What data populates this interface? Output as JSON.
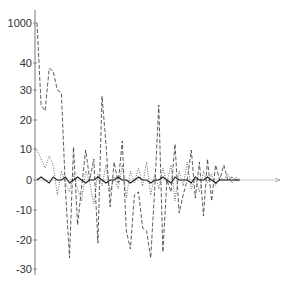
{
  "chart_data": {
    "type": "line",
    "title": "",
    "xlabel": "",
    "ylabel": "",
    "y_ticks": [
      "1000",
      "40",
      "30",
      "20",
      "10",
      "0",
      "-10",
      "-20",
      "-30"
    ],
    "ylim": [
      -30,
      1000
    ],
    "y_axis_break": "between 40 and 1000",
    "grid": false,
    "legend": null,
    "x": [
      0,
      2,
      4,
      6,
      8,
      10,
      12,
      14,
      16,
      18,
      20,
      22,
      24,
      26,
      28,
      30,
      32,
      34,
      36,
      38,
      40,
      42,
      44,
      46,
      48,
      50,
      52,
      54,
      56,
      58,
      60,
      62,
      64,
      66,
      68,
      70,
      72,
      74,
      76,
      78,
      80,
      82,
      84,
      86,
      88,
      90,
      92,
      94,
      96,
      98,
      100
    ],
    "series": [
      {
        "name": "dashed",
        "style": "dashed",
        "values": [
          1000,
          25,
          23,
          38,
          37,
          30,
          29,
          -3,
          -26,
          11,
          -15,
          -2,
          10,
          0,
          7,
          -21,
          28,
          12,
          -9,
          6,
          -1,
          13,
          -17,
          -23,
          -5,
          -4,
          -16,
          -17,
          -26,
          -3,
          25,
          -24,
          0,
          -4,
          12,
          -11,
          -5,
          0,
          10,
          -6,
          6,
          -12,
          7,
          -7,
          5,
          0,
          5,
          0,
          1,
          0,
          0
        ]
      },
      {
        "name": "dotted",
        "style": "dotted",
        "values": [
          10,
          7,
          4,
          8,
          5,
          -5,
          3,
          -1,
          -4,
          2,
          -3,
          -7,
          3,
          -1,
          -8,
          2,
          -2,
          5,
          -4,
          1,
          -3,
          5,
          -6,
          3,
          -1,
          4,
          -2,
          6,
          -5,
          2,
          -3,
          4,
          -1,
          5,
          -7,
          3,
          -2,
          6,
          -3,
          1,
          -4,
          3,
          -1,
          2,
          -2,
          1,
          0,
          2,
          -1,
          1,
          0
        ]
      },
      {
        "name": "solid",
        "style": "solid",
        "values": [
          0,
          1,
          0,
          -1,
          1,
          0,
          0,
          1,
          -1,
          0,
          1,
          0,
          -1,
          0,
          0,
          1,
          0,
          -1,
          0,
          0,
          1,
          0,
          0,
          -1,
          0,
          1,
          0,
          0,
          -1,
          0,
          0,
          1,
          0,
          -1,
          1,
          0,
          0,
          0,
          -1,
          1,
          0,
          0,
          1,
          0,
          -1,
          0,
          0,
          0,
          0,
          0,
          0
        ]
      }
    ],
    "x_axis_extent": "extends beyond data with arrowhead"
  }
}
